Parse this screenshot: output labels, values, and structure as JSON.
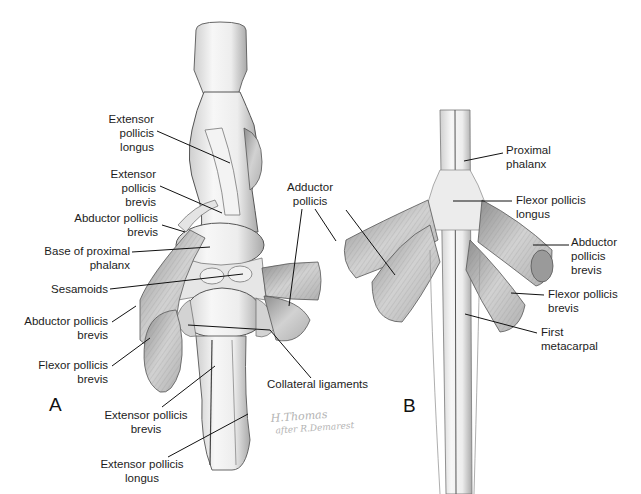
{
  "figure": {
    "panels": [
      {
        "id": "A",
        "label": "A",
        "view": "dorsal view of thumb metacarpophalangeal joint"
      },
      {
        "id": "B",
        "label": "B",
        "view": "palmar view of thumb"
      }
    ],
    "signature": {
      "line1": "H.Thomas",
      "line2": "after R.Demarest"
    }
  },
  "panel_a": {
    "labels": [
      {
        "id": "epl-top",
        "text": "Extensor\npollicis\nlongus"
      },
      {
        "id": "epb-top",
        "text": "Extensor\npollicis\nbrevis"
      },
      {
        "id": "apb-top",
        "text": "Abductor pollicis\nbrevis"
      },
      {
        "id": "base-prox-phalanx",
        "text": "Base of proximal\nphalanx"
      },
      {
        "id": "sesamoids",
        "text": "Sesamoids"
      },
      {
        "id": "apb-bottom",
        "text": "Abductor pollicis\nbrevis"
      },
      {
        "id": "fpb",
        "text": "Flexor pollicis\nbrevis"
      },
      {
        "id": "epb-bottom",
        "text": "Extensor pollicis\nbrevis"
      },
      {
        "id": "epl-bottom",
        "text": "Extensor pollicis\nlongus"
      },
      {
        "id": "adductor",
        "text": "Adductor\npollicis"
      },
      {
        "id": "collateral",
        "text": "Collateral ligaments"
      }
    ]
  },
  "panel_b": {
    "labels": [
      {
        "id": "prox-phalanx",
        "text": "Proximal\nphalanx"
      },
      {
        "id": "fpl",
        "text": "Flexor pollicis\nlongus"
      },
      {
        "id": "apb",
        "text": "Abductor\npollicis\nbrevis"
      },
      {
        "id": "fpb",
        "text": "Flexor pollicis\nbrevis"
      },
      {
        "id": "first-metacarpal",
        "text": "First\nmetacarpal"
      }
    ]
  },
  "colors": {
    "background": "#ffffff",
    "text": "#1c1c1c",
    "leader_line": "#111111",
    "bone_fill": "#f1f1f1",
    "muscle_fill": "#c9c9c9",
    "outline": "#555555"
  }
}
